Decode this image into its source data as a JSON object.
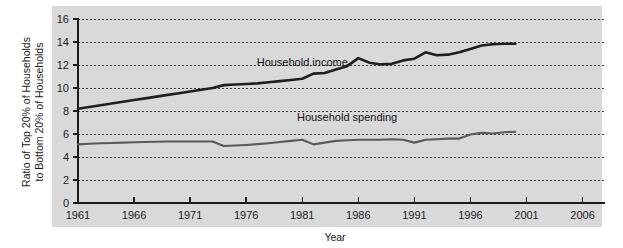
{
  "chart_data": {
    "type": "line",
    "title": "",
    "xlabel": "Year",
    "ylabel": "Ratio of Top 20% of Households to Bottom 20% of Households",
    "ylabel_line1": "Ratio of Top 20% of Households",
    "ylabel_line2": "to Bottom 20% of Households",
    "xlim": [
      1961,
      2008
    ],
    "ylim": [
      0,
      16
    ],
    "xticks": [
      1961,
      1966,
      1971,
      1976,
      1981,
      1986,
      1991,
      1996,
      2001,
      2006
    ],
    "yticks": [
      0,
      2,
      4,
      6,
      8,
      10,
      12,
      14,
      16
    ],
    "grid": "horizontal-dotted",
    "legend": "inline-annotations",
    "plot_background": "#d9d9d9",
    "series": [
      {
        "name": "Household income",
        "label": "Household income",
        "color": "#1f1f1f",
        "label_x": 1981,
        "label_y": 11.9,
        "x": [
          1961,
          1962,
          1963,
          1964,
          1965,
          1966,
          1967,
          1968,
          1969,
          1970,
          1971,
          1972,
          1973,
          1974,
          1975,
          1976,
          1977,
          1978,
          1979,
          1980,
          1981,
          1982,
          1983,
          1984,
          1985,
          1986,
          1987,
          1988,
          1989,
          1990,
          1991,
          1992,
          1993,
          1994,
          1995,
          1996,
          1997,
          1998,
          1999,
          2000
        ],
        "y": [
          8.2,
          8.35,
          8.5,
          8.65,
          8.8,
          8.95,
          9.1,
          9.25,
          9.4,
          9.55,
          9.7,
          9.85,
          10.0,
          10.25,
          10.3,
          10.35,
          10.4,
          10.5,
          10.6,
          10.7,
          10.8,
          11.25,
          11.3,
          11.6,
          11.9,
          12.6,
          12.2,
          12.05,
          12.1,
          12.4,
          12.55,
          13.1,
          12.85,
          12.9,
          13.1,
          13.4,
          13.7,
          13.8,
          13.85,
          13.85
        ]
      },
      {
        "name": "Household spending",
        "label": "Household spending",
        "color": "#5a5a5a",
        "label_x": 1985,
        "label_y": 7.1,
        "x": [
          1961,
          1962,
          1963,
          1964,
          1965,
          1966,
          1967,
          1968,
          1969,
          1970,
          1971,
          1972,
          1973,
          1974,
          1975,
          1976,
          1977,
          1978,
          1979,
          1980,
          1981,
          1982,
          1983,
          1984,
          1985,
          1986,
          1987,
          1988,
          1989,
          1990,
          1991,
          1992,
          1993,
          1994,
          1995,
          1996,
          1997,
          1998,
          1999,
          2000
        ],
        "y": [
          5.1,
          5.15,
          5.2,
          5.22,
          5.25,
          5.28,
          5.3,
          5.32,
          5.35,
          5.35,
          5.35,
          5.35,
          5.35,
          4.95,
          5.0,
          5.05,
          5.12,
          5.2,
          5.3,
          5.4,
          5.5,
          5.1,
          5.25,
          5.4,
          5.45,
          5.5,
          5.5,
          5.5,
          5.55,
          5.5,
          5.25,
          5.5,
          5.55,
          5.6,
          5.6,
          5.95,
          6.1,
          6.05,
          6.15,
          6.2
        ]
      }
    ]
  }
}
